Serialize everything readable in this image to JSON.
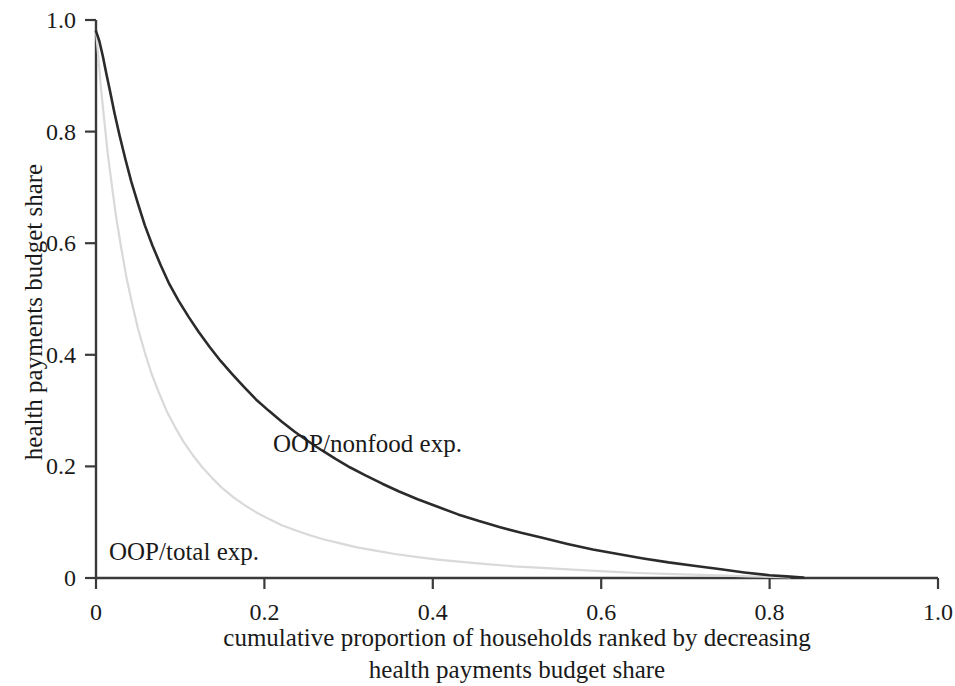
{
  "axes": {
    "y_title": "health payments budget share",
    "x_title_line1": "cumulative proportion of households ranked by decreasing",
    "x_title_line2": "health payments budget share",
    "y_ticks": [
      "0",
      "0.2",
      "0.4",
      "0.6",
      "0.8",
      "1.0"
    ],
    "x_ticks": [
      "0",
      "0.2",
      "0.4",
      "0.6",
      "0.8",
      "1.0"
    ]
  },
  "series_labels": {
    "nonfood": "OOP/nonfood exp.",
    "total": "OOP/total exp."
  },
  "colors": {
    "axis": "#3a3a3a",
    "nonfood_line": "#2b2b2b",
    "total_line": "#d9d9d9",
    "background": "#ffffff",
    "text": "#1a1a1a"
  },
  "chart_data": {
    "type": "line",
    "title": "",
    "subtitle": "",
    "xlabel": "cumulative proportion of households ranked by decreasing health payments budget share",
    "ylabel": "health payments budget share",
    "xlim": [
      0,
      1.0
    ],
    "ylim": [
      0,
      1.0
    ],
    "xticks": [
      0,
      0.2,
      0.4,
      0.6,
      0.8,
      1.0
    ],
    "yticks": [
      0,
      0.2,
      0.4,
      0.6,
      0.8,
      1.0
    ],
    "grid": false,
    "legend": "inline annotations next to curves",
    "annotations": [
      {
        "text": "OOP/nonfood exp.",
        "x": 0.21,
        "y": 0.235
      },
      {
        "text": "OOP/total exp.",
        "x": 0.015,
        "y": 0.055
      }
    ],
    "series": [
      {
        "name": "OOP/nonfood exp.",
        "color": "#2b2b2b",
        "linewidth": 2.6,
        "x": [
          0.0,
          0.004,
          0.008,
          0.012,
          0.017,
          0.022,
          0.028,
          0.035,
          0.042,
          0.05,
          0.058,
          0.067,
          0.077,
          0.087,
          0.098,
          0.11,
          0.122,
          0.135,
          0.148,
          0.162,
          0.176,
          0.19,
          0.205,
          0.22,
          0.236,
          0.252,
          0.268,
          0.285,
          0.302,
          0.32,
          0.34,
          0.36,
          0.382,
          0.405,
          0.43,
          0.455,
          0.48,
          0.505,
          0.53,
          0.56,
          0.59,
          0.62,
          0.65,
          0.68,
          0.71,
          0.74,
          0.77,
          0.8,
          0.82,
          0.84
        ],
        "y": [
          0.98,
          0.962,
          0.936,
          0.906,
          0.87,
          0.833,
          0.793,
          0.75,
          0.71,
          0.67,
          0.632,
          0.596,
          0.56,
          0.527,
          0.497,
          0.468,
          0.441,
          0.414,
          0.389,
          0.365,
          0.342,
          0.32,
          0.3,
          0.281,
          0.262,
          0.245,
          0.229,
          0.213,
          0.198,
          0.184,
          0.169,
          0.155,
          0.141,
          0.128,
          0.114,
          0.102,
          0.091,
          0.081,
          0.072,
          0.061,
          0.051,
          0.043,
          0.035,
          0.028,
          0.022,
          0.016,
          0.01,
          0.005,
          0.003,
          0.001
        ]
      },
      {
        "name": "OOP/total exp.",
        "color": "#d9d9d9",
        "linewidth": 2.2,
        "x": [
          0.0,
          0.003,
          0.006,
          0.01,
          0.014,
          0.019,
          0.024,
          0.03,
          0.036,
          0.043,
          0.05,
          0.058,
          0.066,
          0.075,
          0.084,
          0.094,
          0.104,
          0.115,
          0.126,
          0.138,
          0.15,
          0.163,
          0.176,
          0.19,
          0.205,
          0.22,
          0.236,
          0.253,
          0.271,
          0.29,
          0.31,
          0.332,
          0.355,
          0.38,
          0.406,
          0.434,
          0.464,
          0.496,
          0.53,
          0.566,
          0.604,
          0.644,
          0.686,
          0.73,
          0.776,
          0.824
        ],
        "y": [
          0.98,
          0.93,
          0.876,
          0.818,
          0.76,
          0.702,
          0.646,
          0.591,
          0.54,
          0.491,
          0.446,
          0.404,
          0.366,
          0.331,
          0.299,
          0.27,
          0.244,
          0.22,
          0.199,
          0.179,
          0.161,
          0.145,
          0.131,
          0.118,
          0.106,
          0.095,
          0.086,
          0.077,
          0.069,
          0.062,
          0.055,
          0.049,
          0.043,
          0.038,
          0.033,
          0.029,
          0.025,
          0.021,
          0.018,
          0.015,
          0.012,
          0.009,
          0.007,
          0.005,
          0.003,
          0.001
        ]
      }
    ]
  }
}
